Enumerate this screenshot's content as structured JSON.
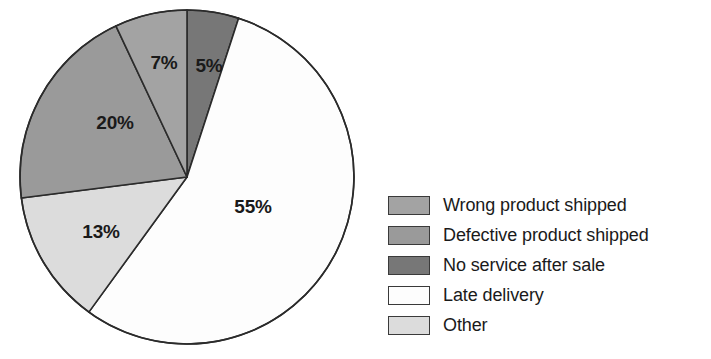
{
  "chart_data": {
    "type": "pie",
    "title": "",
    "subtitle": "",
    "xlabel": "",
    "ylabel": "",
    "legend_position": "right",
    "grid": false,
    "start_angle_deg": 0,
    "direction": "clockwise",
    "categories": [
      "Wrong product shipped",
      "Defective product shipped",
      "No service after sale",
      "Late delivery",
      "Other"
    ],
    "values": [
      7,
      20,
      5,
      55,
      13
    ],
    "value_labels": [
      "7%",
      "20%",
      "5%",
      "55%",
      "13%"
    ],
    "colors": [
      "#a3a3a3",
      "#9a9a9a",
      "#777777",
      "#fdfdfd",
      "#dcdcdc"
    ],
    "slices": [
      {
        "label": "No service after sale",
        "value": 5,
        "value_label": "5%",
        "color": "#777777",
        "start_deg": 0,
        "end_deg": 18,
        "label_x": 209,
        "label_y": 72
      },
      {
        "label": "Late delivery",
        "value": 55,
        "value_label": "55%",
        "color": "#fdfdfd",
        "start_deg": 18,
        "end_deg": 216,
        "label_x": 253,
        "label_y": 213
      },
      {
        "label": "Other",
        "value": 13,
        "value_label": "13%",
        "color": "#dcdcdc",
        "start_deg": 216,
        "end_deg": 262.8,
        "label_x": 101,
        "label_y": 238
      },
      {
        "label": "Defective product shipped",
        "value": 20,
        "value_label": "20%",
        "color": "#9a9a9a",
        "start_deg": 262.8,
        "end_deg": 334.8,
        "label_x": 115,
        "label_y": 129
      },
      {
        "label": "Wrong product shipped",
        "value": 7,
        "value_label": "7%",
        "color": "#a3a3a3",
        "start_deg": 334.8,
        "end_deg": 360,
        "label_x": 164,
        "label_y": 69
      }
    ],
    "geometry": {
      "center_x": 187,
      "center_y": 177,
      "radius": 167,
      "outline_color": "#2b2b2b"
    }
  },
  "legend": {
    "items": [
      {
        "label": "Wrong product shipped",
        "color": "#a3a3a3"
      },
      {
        "label": "Defective product shipped",
        "color": "#9a9a9a"
      },
      {
        "label": "No service after sale",
        "color": "#777777"
      },
      {
        "label": "Late delivery",
        "color": "#fdfdfd"
      },
      {
        "label": "Other",
        "color": "#dcdcdc"
      }
    ]
  }
}
